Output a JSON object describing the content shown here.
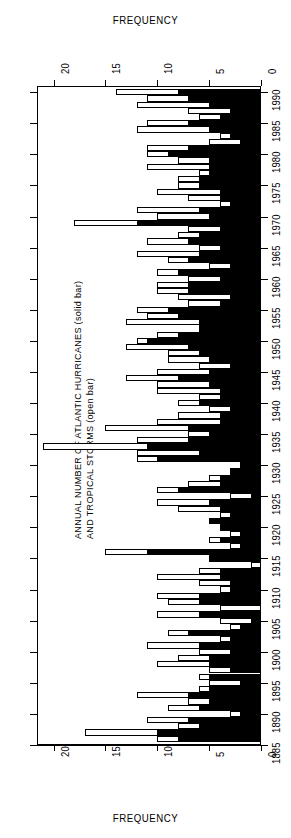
{
  "axis_caption_top": "FREQUENCY",
  "axis_caption_bottom": "FREQUENCY",
  "title_line1": "ANNUAL NUMBER OF ATLANTIC HURRICANES (solid bar)",
  "title_line2": "AND TROPICAL STORMS (open bar)",
  "freq_ticks": [
    "0",
    "5",
    "10",
    "15",
    "20"
  ],
  "year_ticks": [
    "1885",
    "1890",
    "1895",
    "1900",
    "1905",
    "1910",
    "1915",
    "1920",
    "1925",
    "1930",
    "1935",
    "1940",
    "1945",
    "1950",
    "1955",
    "1960",
    "1965",
    "1970",
    "1975",
    "1980",
    "1985",
    "1990"
  ],
  "chart_data": {
    "type": "bar",
    "orientation": "horizontal",
    "title": "ANNUAL NUMBER OF ATLANTIC HURRICANES (solid bar) AND TROPICAL STORMS (open bar)",
    "xlabel": "FREQUENCY",
    "ylabel": "",
    "xlim": [
      0,
      21.6
    ],
    "ylim": [
      1885,
      1991
    ],
    "grid": false,
    "legend": [
      "HURRICANES (solid bar)",
      "TROPICAL STORMS (open bar)"
    ],
    "legend_position": "in-title",
    "xticks": [
      0,
      5,
      10,
      15,
      20
    ],
    "yticks": [
      1885,
      1890,
      1895,
      1900,
      1905,
      1910,
      1915,
      1920,
      1925,
      1930,
      1935,
      1940,
      1945,
      1950,
      1955,
      1960,
      1965,
      1970,
      1975,
      1980,
      1985,
      1990
    ],
    "series": [
      {
        "name": "TROPICAL STORMS (open bar)",
        "style": "open"
      },
      {
        "name": "HURRICANES (solid bar)",
        "style": "solid"
      }
    ],
    "categories": [
      1886,
      1887,
      1888,
      1889,
      1890,
      1891,
      1892,
      1893,
      1894,
      1895,
      1896,
      1897,
      1898,
      1899,
      1900,
      1901,
      1902,
      1903,
      1904,
      1905,
      1906,
      1907,
      1908,
      1909,
      1910,
      1911,
      1912,
      1913,
      1914,
      1915,
      1916,
      1917,
      1918,
      1919,
      1920,
      1921,
      1922,
      1923,
      1924,
      1925,
      1926,
      1927,
      1928,
      1929,
      1930,
      1931,
      1932,
      1933,
      1934,
      1935,
      1936,
      1937,
      1938,
      1939,
      1940,
      1941,
      1942,
      1943,
      1944,
      1945,
      1946,
      1947,
      1948,
      1949,
      1950,
      1951,
      1952,
      1953,
      1954,
      1955,
      1956,
      1957,
      1958,
      1959,
      1960,
      1961,
      1962,
      1963,
      1964,
      1965,
      1966,
      1967,
      1968,
      1969,
      1970,
      1971,
      1972,
      1973,
      1974,
      1975,
      1976,
      1977,
      1978,
      1979,
      1980,
      1981,
      1982,
      1983,
      1984,
      1985,
      1986,
      1987,
      1988,
      1989,
      1990
    ],
    "storms": [
      10,
      17,
      8,
      11,
      3,
      9,
      7,
      12,
      6,
      5,
      6,
      5,
      10,
      8,
      6,
      11,
      4,
      9,
      3,
      4,
      10,
      4,
      9,
      10,
      4,
      6,
      10,
      6,
      1,
      5,
      15,
      3,
      5,
      3,
      4,
      5,
      4,
      8,
      10,
      3,
      10,
      7,
      5,
      2,
      2,
      12,
      12,
      21,
      12,
      7,
      15,
      10,
      8,
      5,
      8,
      6,
      10,
      10,
      13,
      10,
      6,
      9,
      9,
      13,
      12,
      10,
      6,
      13,
      11,
      12,
      7,
      8,
      10,
      10,
      7,
      10,
      5,
      9,
      12,
      6,
      11,
      8,
      7,
      18,
      10,
      12,
      4,
      7,
      10,
      8,
      8,
      6,
      11,
      8,
      11,
      11,
      5,
      4,
      12,
      11,
      6,
      7,
      12,
      11,
      14
    ],
    "hurricanes": [
      8,
      10,
      6,
      7,
      2,
      6,
      5,
      7,
      5,
      2,
      5,
      3,
      5,
      5,
      3,
      6,
      3,
      7,
      2,
      1,
      6,
      0,
      6,
      6,
      3,
      3,
      4,
      4,
      0,
      5,
      11,
      2,
      4,
      2,
      4,
      5,
      3,
      4,
      5,
      1,
      8,
      4,
      4,
      3,
      2,
      10,
      6,
      11,
      7,
      5,
      7,
      4,
      4,
      3,
      6,
      4,
      4,
      5,
      8,
      5,
      3,
      5,
      6,
      7,
      11,
      8,
      6,
      6,
      8,
      9,
      4,
      3,
      7,
      7,
      4,
      8,
      3,
      7,
      6,
      4,
      7,
      6,
      4,
      12,
      5,
      6,
      3,
      4,
      4,
      6,
      6,
      5,
      5,
      5,
      9,
      7,
      2,
      3,
      5,
      7,
      4,
      3,
      5,
      7,
      8
    ]
  }
}
